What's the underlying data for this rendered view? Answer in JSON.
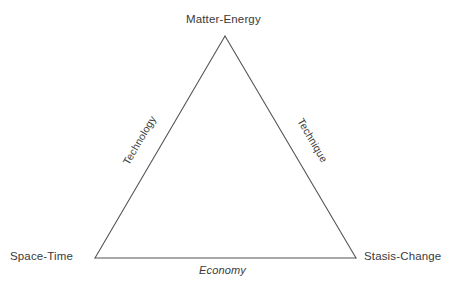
{
  "diagram": {
    "background_color": "#ffffff",
    "stroke_color": "#555555",
    "text_color": "#3a3a3a",
    "vertices": [
      {
        "id": "top",
        "label": "Matter-Energy",
        "x": 225,
        "y": 36
      },
      {
        "id": "bottom_left",
        "label": "Space-Time",
        "x": 95,
        "y": 258
      },
      {
        "id": "bottom_right",
        "label": "Stasis-Change",
        "x": 356,
        "y": 258
      }
    ],
    "edges": [
      {
        "id": "left",
        "label": "Technology",
        "from": "bottom_left",
        "to": "top",
        "style": "normal",
        "rotation_deg": -59.6
      },
      {
        "id": "right",
        "label": "Technique",
        "from": "top",
        "to": "bottom_right",
        "style": "normal",
        "rotation_deg": 59.6
      },
      {
        "id": "bottom",
        "label": "Economy",
        "from": "bottom_left",
        "to": "bottom_right",
        "style": "italic",
        "rotation_deg": 0
      }
    ]
  }
}
